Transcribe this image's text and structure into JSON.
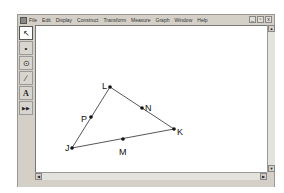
{
  "menubar": {
    "items": [
      "File",
      "Edit",
      "Display",
      "Construct",
      "Transform",
      "Measure",
      "Graph",
      "Window",
      "Help"
    ],
    "controls": [
      "_",
      "▫",
      "x"
    ]
  },
  "toolbox": {
    "tools": [
      {
        "name": "selection-arrow-tool",
        "glyph": "↖"
      },
      {
        "name": "point-tool",
        "glyph": "•"
      },
      {
        "name": "compass-tool",
        "glyph": "⊙"
      },
      {
        "name": "straightedge-tool",
        "glyph": "∕"
      },
      {
        "name": "text-tool",
        "glyph": "A"
      },
      {
        "name": "custom-tool",
        "glyph": "▶▶"
      }
    ]
  },
  "scrollbar": {
    "up": "▲",
    "down": "▼",
    "left": "◀",
    "right": "▶"
  },
  "figure": {
    "points": [
      {
        "label": "L",
        "x": 110,
        "y": 87,
        "lx": 102,
        "ly": 86
      },
      {
        "label": "K",
        "x": 174,
        "y": 129,
        "lx": 177,
        "ly": 132
      },
      {
        "label": "J",
        "x": 72,
        "y": 148,
        "lx": 65,
        "ly": 148
      },
      {
        "label": "N",
        "x": 142,
        "y": 108,
        "lx": 145,
        "ly": 108
      },
      {
        "label": "M",
        "x": 123,
        "y": 139,
        "lx": 119,
        "ly": 152
      },
      {
        "label": "P",
        "x": 91,
        "y": 117,
        "lx": 81,
        "ly": 119
      }
    ],
    "segments": [
      [
        "L",
        "K"
      ],
      [
        "K",
        "J"
      ],
      [
        "J",
        "L"
      ]
    ]
  }
}
